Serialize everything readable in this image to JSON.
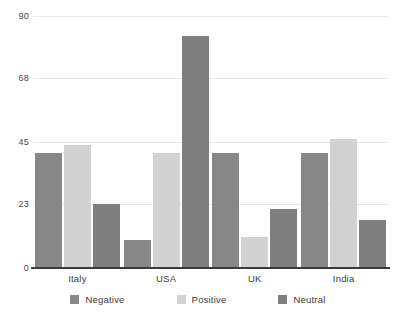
{
  "chart_data": {
    "type": "bar",
    "title": "",
    "subtitle": "",
    "xlabel": "",
    "ylabel": "",
    "categories": [
      "Italy",
      "USA",
      "UK",
      "India"
    ],
    "series": [
      {
        "name": "Negative",
        "color": "#878787",
        "values": [
          41,
          10,
          41,
          41
        ]
      },
      {
        "name": "Positive",
        "color": "#d2d2d2",
        "values": [
          44,
          41,
          11,
          46
        ]
      },
      {
        "name": "Neutral",
        "color": "#7f7f7f",
        "values": [
          23,
          83,
          21,
          17
        ]
      }
    ],
    "ylim": [
      0,
      90
    ],
    "yticks": [
      0,
      23,
      45,
      68,
      90
    ],
    "ytick_labels": [
      "0",
      "23",
      "45",
      "68",
      "90"
    ],
    "grid": true,
    "grid_color": "#e8e8e8",
    "legend_position": "bottom",
    "background": "#ffffff",
    "axis_color": "#3a3a3a"
  }
}
